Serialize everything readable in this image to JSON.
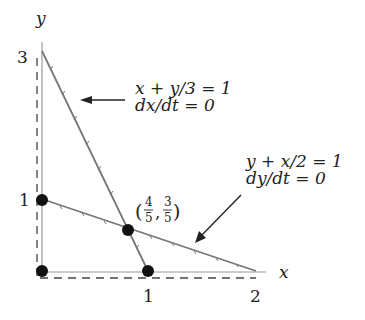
{
  "diagram": {
    "axes": {
      "x_label": "x",
      "y_label": "y",
      "x_ticks": [
        "1",
        "2"
      ],
      "y_ticks": [
        "1",
        "3"
      ]
    },
    "lines": [
      {
        "id": "x-nullcline",
        "equation": "x + y/3 = 1",
        "condition": "dx/dt = 0",
        "from": [
          0,
          3
        ],
        "to": [
          1,
          0
        ]
      },
      {
        "id": "y-nullcline",
        "equation": "y + x/2 = 1",
        "condition": "dy/dt = 0",
        "from": [
          0,
          1
        ],
        "to": [
          2,
          0
        ]
      }
    ],
    "points": [
      {
        "id": "origin",
        "coords": [
          0,
          0
        ]
      },
      {
        "id": "y-intercept-1",
        "coords": [
          0,
          1
        ]
      },
      {
        "id": "x-intercept-1",
        "coords": [
          1,
          0
        ]
      },
      {
        "id": "intersection",
        "coords": [
          0.8,
          0.6
        ],
        "label_open": "(",
        "label_x_num": "4",
        "label_x_den": "5",
        "label_sep": ",",
        "label_y_num": "3",
        "label_y_den": "5",
        "label_close": ")"
      }
    ],
    "colors": {
      "line": "#777777",
      "axis": "#999999",
      "point": "#111111",
      "text": "#222222"
    }
  }
}
